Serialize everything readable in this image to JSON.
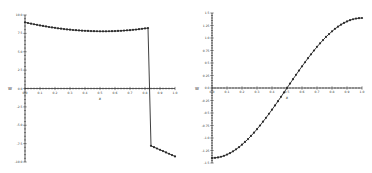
{
  "chart_data": [
    {
      "type": "line",
      "title": "",
      "xlabel": "x",
      "ylabel": "W",
      "xlim": [
        0,
        1.0
      ],
      "ylim": [
        -10.0,
        10.0
      ],
      "xticks": [
        "0.0",
        "0.1",
        "0.2",
        "0.3",
        "0.4",
        "0.5",
        "0.6",
        "0.7",
        "0.8",
        "0.9",
        "1.0"
      ],
      "xtick_values": [
        0,
        0.1,
        0.2,
        0.3,
        0.4,
        0.5,
        0.6,
        0.7,
        0.8,
        0.9,
        1.0
      ],
      "yticks": [
        "10.0",
        "7.5",
        "5.0",
        "2.5",
        "0.0",
        "-2.5",
        "-5.0",
        "-7.5",
        "-10.0"
      ],
      "ytick_values": [
        10,
        7.5,
        5,
        2.5,
        0,
        -2.5,
        -5,
        -7.5,
        -10
      ],
      "grid": false,
      "series": [
        {
          "name": "W",
          "x": [
            0,
            0.02,
            0.04,
            0.06,
            0.08,
            0.1,
            0.12,
            0.14,
            0.16,
            0.18,
            0.2,
            0.22,
            0.24,
            0.26,
            0.28,
            0.3,
            0.32,
            0.34,
            0.36,
            0.38,
            0.4,
            0.42,
            0.44,
            0.46,
            0.48,
            0.5,
            0.52,
            0.54,
            0.56,
            0.58,
            0.6,
            0.62,
            0.64,
            0.66,
            0.68,
            0.7,
            0.72,
            0.74,
            0.76,
            0.78,
            0.8,
            0.82,
            0.84,
            0.86,
            0.88,
            0.9,
            0.92,
            0.94,
            0.96,
            0.98,
            1.0
          ],
          "y": [
            9.0,
            8.91,
            8.82,
            8.74,
            8.66,
            8.58,
            8.51,
            8.44,
            8.37,
            8.31,
            8.25,
            8.19,
            8.14,
            8.09,
            8.04,
            8.0,
            7.96,
            7.93,
            7.9,
            7.87,
            7.85,
            7.83,
            7.81,
            7.8,
            7.79,
            7.78,
            7.78,
            7.78,
            7.79,
            7.8,
            7.81,
            7.83,
            7.85,
            7.88,
            7.91,
            7.94,
            7.98,
            8.02,
            8.07,
            8.12,
            8.17,
            8.22,
            -7.8,
            -7.98,
            -8.16,
            -8.34,
            -8.52,
            -8.7,
            -8.88,
            -9.06,
            -9.24
          ]
        }
      ]
    },
    {
      "type": "line",
      "title": "",
      "xlabel": "x",
      "ylabel": "W",
      "xlim": [
        0,
        1.0
      ],
      "ylim": [
        -1.5,
        1.5
      ],
      "xticks": [
        "0.0",
        "0.1",
        "0.2",
        "0.3",
        "0.4",
        "0.5",
        "0.6",
        "0.7",
        "0.8",
        "0.9",
        "1.0"
      ],
      "xtick_values": [
        0,
        0.1,
        0.2,
        0.3,
        0.4,
        0.5,
        0.6,
        0.7,
        0.8,
        0.9,
        1.0
      ],
      "yticks": [
        "1.5",
        "1.25",
        "1.0",
        "0.75",
        "0.5",
        "0.25",
        "0.0",
        "-0.25",
        "-0.5",
        "-0.75",
        "-1.0",
        "-1.25",
        "-1.5"
      ],
      "ytick_values": [
        1.5,
        1.25,
        1.0,
        0.75,
        0.5,
        0.25,
        0,
        -0.25,
        -0.5,
        -0.75,
        -1.0,
        -1.25,
        -1.5
      ],
      "grid": false,
      "series": [
        {
          "name": "W",
          "x": [
            0,
            0.02,
            0.04,
            0.06,
            0.08,
            0.1,
            0.12,
            0.14,
            0.16,
            0.18,
            0.2,
            0.22,
            0.24,
            0.26,
            0.28,
            0.3,
            0.32,
            0.34,
            0.36,
            0.38,
            0.4,
            0.42,
            0.44,
            0.46,
            0.48,
            0.5,
            0.52,
            0.54,
            0.56,
            0.58,
            0.6,
            0.62,
            0.64,
            0.66,
            0.68,
            0.7,
            0.72,
            0.74,
            0.76,
            0.78,
            0.8,
            0.82,
            0.84,
            0.86,
            0.88,
            0.9,
            0.92,
            0.94,
            0.96,
            0.98,
            1.0
          ],
          "y": [
            -1.4,
            -1.397,
            -1.389,
            -1.375,
            -1.356,
            -1.331,
            -1.302,
            -1.267,
            -1.227,
            -1.183,
            -1.133,
            -1.079,
            -1.021,
            -0.959,
            -0.893,
            -0.823,
            -0.75,
            -0.674,
            -0.596,
            -0.515,
            -0.433,
            -0.349,
            -0.263,
            -0.176,
            -0.088,
            0.0,
            0.088,
            0.176,
            0.263,
            0.349,
            0.433,
            0.515,
            0.596,
            0.674,
            0.75,
            0.823,
            0.893,
            0.959,
            1.021,
            1.079,
            1.133,
            1.183,
            1.227,
            1.267,
            1.302,
            1.331,
            1.356,
            1.375,
            1.389,
            1.397,
            1.4
          ]
        }
      ]
    }
  ]
}
